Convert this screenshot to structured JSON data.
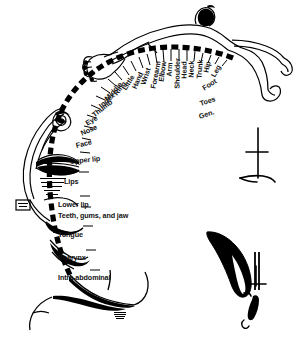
{
  "figure": {
    "ink_color": "#000000",
    "background_color": "#ffffff",
    "signature": "artist-signature-mark"
  },
  "homunculus": {
    "parts": [
      "exaggerated-hand-with-fingers",
      "small-head-and-torso",
      "thin-leg-over-midline",
      "giant-face-with-large-lips"
    ]
  },
  "insets": [
    {
      "name": "hand-scale-inset"
    },
    {
      "name": "tongue-inset"
    },
    {
      "name": "tooth-scale-inset"
    },
    {
      "name": "genital-inset"
    }
  ],
  "labels": [
    {
      "text": "Toes",
      "x": 200,
      "y": 104,
      "rot": -18
    },
    {
      "text": "Gen.",
      "x": 199,
      "y": 117,
      "rot": -18
    },
    {
      "text": "Foot",
      "x": 203,
      "y": 89,
      "rot": -32
    },
    {
      "text": "Leg",
      "x": 213,
      "y": 77,
      "rot": -62
    },
    {
      "text": "Hip",
      "x": 206,
      "y": 73,
      "rot": -78
    },
    {
      "text": "Trunk",
      "x": 199,
      "y": 79,
      "rot": -86
    },
    {
      "text": "Neck",
      "x": 191,
      "y": 78,
      "rot": -88
    },
    {
      "text": "Head",
      "x": 184,
      "y": 79,
      "rot": -89
    },
    {
      "text": "Shoulder",
      "x": 177,
      "y": 89,
      "rot": -89
    },
    {
      "text": "Arm",
      "x": 169,
      "y": 77,
      "rot": -86
    },
    {
      "text": "Elbow",
      "x": 161,
      "y": 82,
      "rot": -82
    },
    {
      "text": "Forearm",
      "x": 153,
      "y": 89,
      "rot": -79
    },
    {
      "text": "Wrist",
      "x": 143,
      "y": 85,
      "rot": -72
    },
    {
      "text": "Hand",
      "x": 134,
      "y": 89,
      "rot": -66
    },
    {
      "text": "Little",
      "x": 124,
      "y": 90,
      "rot": -58
    },
    {
      "text": "Ring",
      "x": 115,
      "y": 95,
      "rot": -52
    },
    {
      "text": "Middle",
      "x": 106,
      "y": 100,
      "rot": -48
    },
    {
      "text": "Index",
      "x": 100,
      "y": 107,
      "rot": -42
    },
    {
      "text": "Thumb",
      "x": 93,
      "y": 116,
      "rot": -38
    },
    {
      "text": "Eye",
      "x": 86,
      "y": 124,
      "rot": -30
    },
    {
      "text": "Nose",
      "x": 81,
      "y": 134,
      "rot": -24
    },
    {
      "text": "Face",
      "x": 76,
      "y": 146,
      "rot": -14
    },
    {
      "text": "Upper lip",
      "x": 70,
      "y": 162,
      "rot": -6
    },
    {
      "text": "Lips",
      "x": 64,
      "y": 182,
      "rot": 0
    },
    {
      "text": "Lower lip",
      "x": 58,
      "y": 205,
      "rot": 0
    },
    {
      "text": "Teeth, gums, and jaw",
      "x": 58,
      "y": 216,
      "rot": 0
    },
    {
      "text": "Tongue",
      "x": 58,
      "y": 235,
      "rot": 0
    },
    {
      "text": "Pharynx",
      "x": 58,
      "y": 258,
      "rot": 0
    },
    {
      "text": "Intra-abdominal",
      "x": 58,
      "y": 278,
      "rot": 0
    }
  ],
  "label_font_size_px": 7.2
}
